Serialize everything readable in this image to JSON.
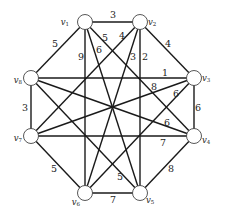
{
  "graph": {
    "title": "",
    "nodes": [
      {
        "id": "v1",
        "label": "v",
        "sub": "1",
        "x": 85,
        "y": 22,
        "lx": 69,
        "ly": 22,
        "anchor": "end"
      },
      {
        "id": "v2",
        "label": "v",
        "sub": "2",
        "x": 140,
        "y": 22,
        "lx": 148,
        "ly": 22,
        "anchor": "start"
      },
      {
        "id": "v3",
        "label": "v",
        "sub": "3",
        "x": 194,
        "y": 78,
        "lx": 202,
        "ly": 78,
        "anchor": "start"
      },
      {
        "id": "v4",
        "label": "v",
        "sub": "4",
        "x": 194,
        "y": 136,
        "lx": 202,
        "ly": 140,
        "anchor": "start"
      },
      {
        "id": "v5",
        "label": "v",
        "sub": "5",
        "x": 140,
        "y": 193,
        "lx": 146,
        "ly": 200,
        "anchor": "start"
      },
      {
        "id": "v6",
        "label": "v",
        "sub": "6",
        "x": 85,
        "y": 193,
        "lx": 80,
        "ly": 202,
        "anchor": "end"
      },
      {
        "id": "v7",
        "label": "v",
        "sub": "7",
        "x": 31,
        "y": 136,
        "lx": 22,
        "ly": 138,
        "anchor": "end"
      },
      {
        "id": "v8",
        "label": "v",
        "sub": "8",
        "x": 31,
        "y": 78,
        "lx": 22,
        "ly": 80,
        "anchor": "end"
      }
    ],
    "edges": [
      {
        "from": "v1",
        "to": "v2",
        "weight": "3",
        "lx": 113,
        "ly": 14
      },
      {
        "from": "v2",
        "to": "v3",
        "weight": "4",
        "lx": 168,
        "ly": 43
      },
      {
        "from": "v3",
        "to": "v4",
        "weight": "6",
        "lx": 198,
        "ly": 107
      },
      {
        "from": "v4",
        "to": "v5",
        "weight": "8",
        "lx": 171,
        "ly": 168
      },
      {
        "from": "v5",
        "to": "v6",
        "weight": "7",
        "lx": 113,
        "ly": 199
      },
      {
        "from": "v6",
        "to": "v7",
        "weight": "5",
        "lx": 54,
        "ly": 168
      },
      {
        "from": "v7",
        "to": "v8",
        "weight": "3",
        "lx": 25,
        "ly": 107
      },
      {
        "from": "v8",
        "to": "v1",
        "weight": "5",
        "lx": 55,
        "ly": 43
      },
      {
        "from": "v1",
        "to": "v6",
        "weight": "9",
        "lx": 81,
        "ly": 56
      },
      {
        "from": "v1",
        "to": "v5",
        "weight": "6",
        "lx": 99,
        "ly": 49
      },
      {
        "from": "v1",
        "to": "v4",
        "weight": "5",
        "lx": 105,
        "ly": 37
      },
      {
        "from": "v2",
        "to": "v7",
        "weight": "4",
        "lx": 122,
        "ly": 35
      },
      {
        "from": "v2",
        "to": "v6",
        "weight": "3",
        "lx": 133,
        "ly": 56
      },
      {
        "from": "v2",
        "to": "v5",
        "weight": "2",
        "lx": 145,
        "ly": 56
      },
      {
        "from": "v8",
        "to": "v3",
        "weight": "1",
        "lx": 165,
        "ly": 72
      },
      {
        "from": "v7",
        "to": "v3",
        "weight": "8",
        "lx": 154,
        "ly": 86
      },
      {
        "from": "v6",
        "to": "v3",
        "weight": "6",
        "lx": 176,
        "ly": 93
      },
      {
        "from": "v8",
        "to": "v4",
        "weight": "6",
        "lx": 167,
        "ly": 122
      },
      {
        "from": "v7",
        "to": "v4",
        "weight": "7",
        "lx": 163,
        "ly": 142
      },
      {
        "from": "v8",
        "to": "v5",
        "weight": "5",
        "lx": 120,
        "ly": 176
      }
    ]
  }
}
